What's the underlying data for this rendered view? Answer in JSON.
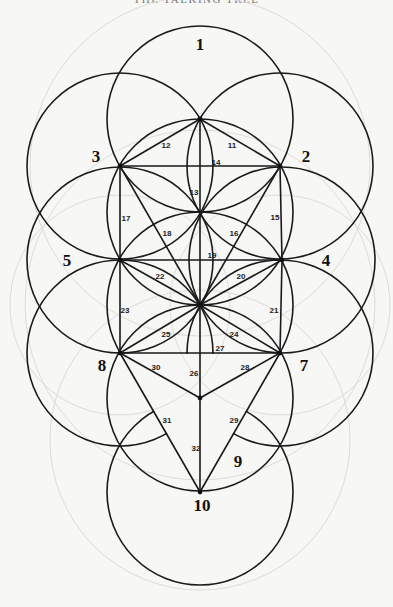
{
  "header": {
    "running_title": "THE TALKING TREE",
    "page_number": ""
  },
  "diagram": {
    "type": "tree-of-life",
    "radius": 93,
    "sephiroth": [
      {
        "id": "1",
        "label": "1",
        "x": 200,
        "y": 119,
        "lx": 200,
        "ly": 50
      },
      {
        "id": "2",
        "label": "2",
        "x": 280,
        "y": 166,
        "lx": 306,
        "ly": 162
      },
      {
        "id": "3",
        "label": "3",
        "x": 120,
        "y": 166,
        "lx": 96,
        "ly": 162
      },
      {
        "id": "4",
        "label": "4",
        "x": 282,
        "y": 260,
        "lx": 326,
        "ly": 266
      },
      {
        "id": "5",
        "label": "5",
        "x": 120,
        "y": 260,
        "lx": 67,
        "ly": 266
      },
      {
        "id": "6",
        "label": "",
        "x": 200,
        "y": 305
      },
      {
        "id": "7",
        "label": "7",
        "x": 280,
        "y": 353,
        "lx": 304,
        "ly": 371
      },
      {
        "id": "8",
        "label": "8",
        "x": 120,
        "y": 353,
        "lx": 102,
        "ly": 371
      },
      {
        "id": "9",
        "label": "9",
        "x": 200,
        "y": 398,
        "lx": 238,
        "ly": 467
      },
      {
        "id": "10",
        "label": "10",
        "x": 200,
        "y": 492,
        "lx": 202,
        "ly": 511
      }
    ],
    "paths": [
      {
        "label": "11",
        "from": "1",
        "to": "2",
        "lx": 232,
        "ly": 148
      },
      {
        "label": "12",
        "from": "1",
        "to": "3",
        "lx": 166,
        "ly": 148
      },
      {
        "label": "13",
        "from": "1",
        "to": "6",
        "lx": 194,
        "ly": 195
      },
      {
        "label": "14",
        "from": "3",
        "to": "2",
        "lx": 216,
        "ly": 165
      },
      {
        "label": "15",
        "from": "2",
        "to": "4",
        "lx": 275,
        "ly": 220
      },
      {
        "label": "16",
        "from": "2",
        "to": "6",
        "lx": 234,
        "ly": 236
      },
      {
        "label": "17",
        "from": "3",
        "to": "5",
        "lx": 126,
        "ly": 221
      },
      {
        "label": "18",
        "from": "3",
        "to": "6",
        "lx": 167,
        "ly": 236
      },
      {
        "label": "19",
        "from": "5",
        "to": "4",
        "lx": 212,
        "ly": 258
      },
      {
        "label": "20",
        "from": "4",
        "to": "6",
        "lx": 241,
        "ly": 279
      },
      {
        "label": "21",
        "from": "4",
        "to": "7",
        "lx": 274,
        "ly": 313
      },
      {
        "label": "22",
        "from": "5",
        "to": "6",
        "lx": 160,
        "ly": 279
      },
      {
        "label": "23",
        "from": "5",
        "to": "8",
        "lx": 125,
        "ly": 313
      },
      {
        "label": "24",
        "from": "6",
        "to": "7",
        "lx": 234,
        "ly": 337
      },
      {
        "label": "25",
        "from": "6",
        "to": "8",
        "lx": 166,
        "ly": 337
      },
      {
        "label": "26",
        "from": "6",
        "to": "9",
        "lx": 194,
        "ly": 376
      },
      {
        "label": "27",
        "from": "8",
        "to": "7",
        "lx": 220,
        "ly": 351
      },
      {
        "label": "28",
        "from": "7",
        "to": "9",
        "lx": 245,
        "ly": 370
      },
      {
        "label": "29",
        "from": "7",
        "to": "10",
        "lx": 234,
        "ly": 423
      },
      {
        "label": "30",
        "from": "8",
        "to": "9",
        "lx": 156,
        "ly": 370
      },
      {
        "label": "31",
        "from": "8",
        "to": "10",
        "lx": 167,
        "ly": 423
      },
      {
        "label": "32",
        "from": "9",
        "to": "10",
        "lx": 196,
        "ly": 451
      }
    ]
  },
  "caption": ""
}
